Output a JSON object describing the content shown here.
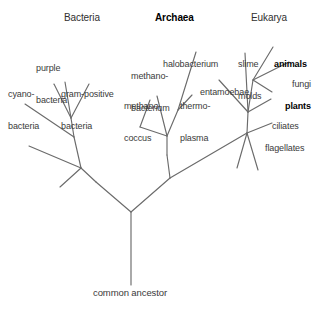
{
  "diagram": {
    "type": "phylogenetic-tree",
    "line_color": "#6b6b6b",
    "text_color": "#3a3a3a",
    "background": "#ffffff",
    "root_label": "common ancestor",
    "domains": [
      {
        "id": "bacteria",
        "label": "Bacteria",
        "bold": false,
        "x": 64,
        "y": 13
      },
      {
        "id": "archaea",
        "label": "Archaea",
        "bold": true,
        "x": 155,
        "y": 13
      },
      {
        "id": "eukarya",
        "label": "Eukarya",
        "bold": false,
        "x": 251,
        "y": 13
      }
    ],
    "taxa": [
      {
        "id": "purple-bacteria",
        "domain": "bacteria",
        "lines": [
          "purple",
          "bacteria"
        ],
        "bold": false,
        "x": 36,
        "y": 42
      },
      {
        "id": "cyanobacteria",
        "domain": "bacteria",
        "lines": [
          "cyano-",
          "bacteria"
        ],
        "bold": false,
        "x": 8,
        "y": 68
      },
      {
        "id": "gram-positive-bacteria",
        "domain": "bacteria",
        "lines": [
          "gram-positive",
          "bacteria"
        ],
        "bold": false,
        "x": 61,
        "y": 68
      },
      {
        "id": "halobacterium",
        "domain": "archaea",
        "lines": [
          "halobacterium"
        ],
        "bold": false,
        "x": 163,
        "y": 38
      },
      {
        "id": "methanobacterium",
        "domain": "archaea",
        "lines": [
          "methano-",
          "bacterium"
        ],
        "bold": false,
        "x": 131,
        "y": 50
      },
      {
        "id": "methanococcus",
        "domain": "archaea",
        "lines": [
          "methano-",
          "coccus"
        ],
        "bold": false,
        "x": 124,
        "y": 80
      },
      {
        "id": "thermoplasma",
        "domain": "archaea",
        "lines": [
          "thermo-",
          "plasma"
        ],
        "bold": false,
        "x": 180,
        "y": 80
      },
      {
        "id": "entamoebae",
        "domain": "eukarya",
        "lines": [
          "entamoebae"
        ],
        "bold": false,
        "x": 200,
        "y": 66
      },
      {
        "id": "slime-molds",
        "domain": "eukarya",
        "lines": [
          "slime",
          "molds"
        ],
        "bold": false,
        "x": 238,
        "y": 38
      },
      {
        "id": "animals",
        "domain": "eukarya",
        "lines": [
          "animals"
        ],
        "bold": true,
        "x": 274,
        "y": 38
      },
      {
        "id": "fungi",
        "domain": "eukarya",
        "lines": [
          "fungi"
        ],
        "bold": false,
        "x": 292,
        "y": 58
      },
      {
        "id": "plants",
        "domain": "eukarya",
        "lines": [
          "plants"
        ],
        "bold": true,
        "x": 285,
        "y": 80
      },
      {
        "id": "ciliates",
        "domain": "eukarya",
        "lines": [
          "ciliates"
        ],
        "bold": false,
        "x": 272,
        "y": 100
      },
      {
        "id": "flagellates",
        "domain": "eukarya",
        "lines": [
          "flagellates"
        ],
        "bold": false,
        "x": 265,
        "y": 122
      }
    ],
    "root": {
      "label": "common ancestor",
      "x": 93,
      "y": 288
    }
  }
}
